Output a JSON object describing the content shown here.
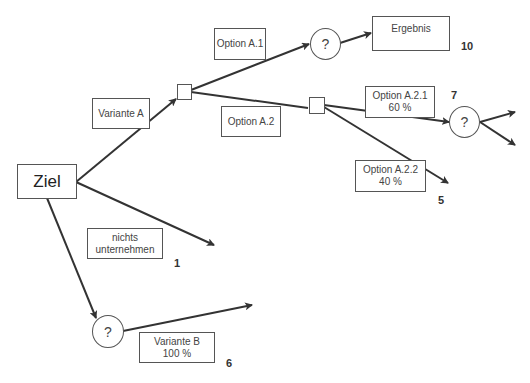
{
  "diagram": {
    "type": "decision-tree",
    "root": {
      "label": "Ziel"
    },
    "edge_labels": {
      "variante_a": "Variante A",
      "option_a1": "Option A.1",
      "option_a2": "Option A.2",
      "option_a21_line1": "Option A.2.1",
      "option_a21_line2": "60 %",
      "option_a22_line1": "Option A.2.2",
      "option_a22_line2": "40 %",
      "nichts_line1": "nichts",
      "nichts_line2": "unternehmen",
      "variante_b_line1": "Variante B",
      "variante_b_line2": "100 %"
    },
    "nodes": {
      "chance_a1": "?",
      "chance_a21": "?",
      "chance_b": "?",
      "result": "Ergebnis"
    },
    "values": {
      "ergebnis": "10",
      "option_a21": "7",
      "option_a22": "5",
      "nichts": "1",
      "variante_b": "6"
    },
    "colors": {
      "line": "#333333",
      "border": "#555555",
      "background": "#ffffff"
    }
  }
}
